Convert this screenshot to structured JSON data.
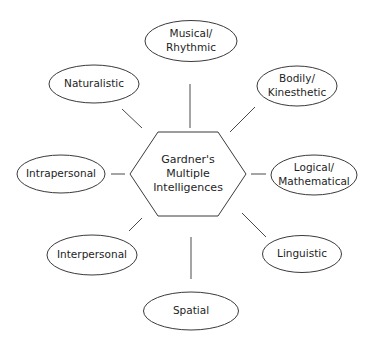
{
  "diagram": {
    "type": "hub-and-spoke",
    "center": {
      "shape": "hexagon",
      "lines": [
        "Gardner's",
        "Multiple",
        "Intelligences"
      ]
    },
    "nodes": [
      {
        "id": "musical",
        "lines": [
          "Musical/",
          "Rhythmic"
        ]
      },
      {
        "id": "bodily",
        "lines": [
          "Bodily/",
          "Kinesthetic"
        ]
      },
      {
        "id": "logical",
        "lines": [
          "Logical/",
          "Mathematical"
        ]
      },
      {
        "id": "linguistic",
        "lines": [
          "Linguistic"
        ]
      },
      {
        "id": "spatial",
        "lines": [
          "Spatial"
        ]
      },
      {
        "id": "interpersonal",
        "lines": [
          "Interpersonal"
        ]
      },
      {
        "id": "intrapersonal",
        "lines": [
          "Intrapersonal"
        ]
      },
      {
        "id": "naturalistic",
        "lines": [
          "Naturalistic"
        ]
      }
    ]
  }
}
